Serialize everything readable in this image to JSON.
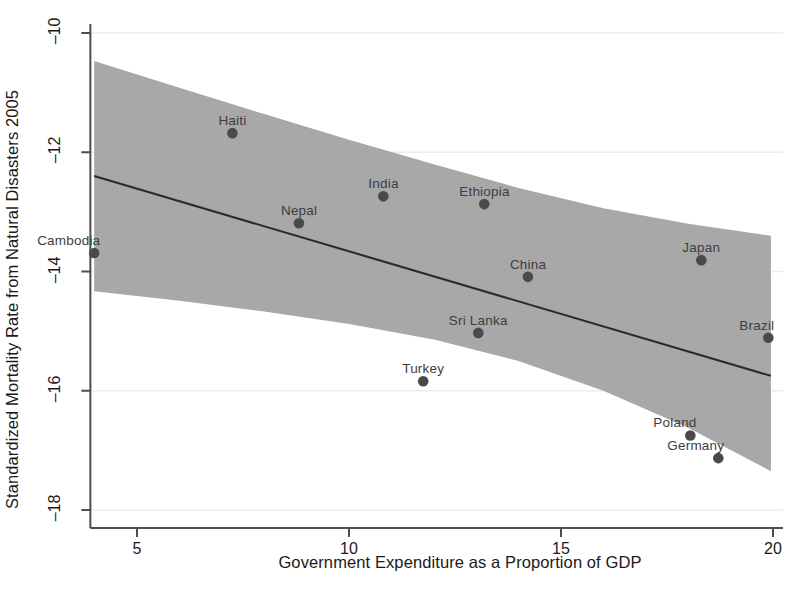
{
  "chart_data": {
    "type": "scatter",
    "title": "",
    "xlabel": "Government Expenditure as a Proportion of GDP",
    "ylabel": "Standardized Mortality Rate from Natural Disasters 2005",
    "xlim": [
      3.9,
      20.1
    ],
    "ylim": [
      -18.3,
      -9.85
    ],
    "xticks": [
      5,
      10,
      15,
      20
    ],
    "xtick_labels": [
      "5",
      "10",
      "15",
      "20"
    ],
    "yticks": [
      -10,
      -12,
      -14,
      -16,
      -18
    ],
    "ytick_labels": [
      "–10",
      "–12",
      "–14",
      "–16",
      "–18"
    ],
    "grid": "horizontal-faint",
    "legend": "none",
    "points": [
      {
        "label": "Cambodia",
        "x": 3.99,
        "y": -13.69,
        "label_pos": "above-left"
      },
      {
        "label": "Haiti",
        "x": 7.25,
        "y": -11.68,
        "label_pos": "above"
      },
      {
        "label": "Nepal",
        "x": 8.82,
        "y": -13.19,
        "label_pos": "above"
      },
      {
        "label": "India",
        "x": 10.81,
        "y": -12.74,
        "label_pos": "above"
      },
      {
        "label": "Turkey",
        "x": 11.75,
        "y": -15.84,
        "label_pos": "above"
      },
      {
        "label": "Sri Lanka",
        "x": 13.05,
        "y": -15.03,
        "label_pos": "above"
      },
      {
        "label": "Ethiopia",
        "x": 13.19,
        "y": -12.87,
        "label_pos": "above"
      },
      {
        "label": "China",
        "x": 14.22,
        "y": -14.09,
        "label_pos": "above"
      },
      {
        "label": "Poland",
        "x": 18.05,
        "y": -16.75,
        "label_pos": "above-left"
      },
      {
        "label": "Japan",
        "x": 18.31,
        "y": -13.81,
        "label_pos": "above"
      },
      {
        "label": "Germany",
        "x": 18.71,
        "y": -17.13,
        "label_pos": "above-left"
      },
      {
        "label": "Brazil",
        "x": 19.89,
        "y": -15.11,
        "label_pos": "above-left"
      }
    ],
    "fit_line": {
      "description": "linear fit",
      "x_start": 3.99,
      "y_start": -12.4,
      "x_end": 19.95,
      "y_end": -15.75
    },
    "confidence_band": {
      "description": "95% confidence interval shading",
      "color": "#a8a8a8",
      "upper": [
        {
          "x": 3.99,
          "y": -10.47
        },
        {
          "x": 6.0,
          "y": -10.92
        },
        {
          "x": 8.0,
          "y": -11.36
        },
        {
          "x": 10.0,
          "y": -11.79
        },
        {
          "x": 12.0,
          "y": -12.2
        },
        {
          "x": 14.0,
          "y": -12.6
        },
        {
          "x": 16.0,
          "y": -12.94
        },
        {
          "x": 18.0,
          "y": -13.2
        },
        {
          "x": 19.95,
          "y": -13.4
        }
      ],
      "lower": [
        {
          "x": 3.99,
          "y": -14.33
        },
        {
          "x": 6.0,
          "y": -14.49
        },
        {
          "x": 8.0,
          "y": -14.67
        },
        {
          "x": 10.0,
          "y": -14.88
        },
        {
          "x": 12.0,
          "y": -15.14
        },
        {
          "x": 14.0,
          "y": -15.5
        },
        {
          "x": 16.0,
          "y": -16.0
        },
        {
          "x": 18.0,
          "y": -16.62
        },
        {
          "x": 19.95,
          "y": -17.35
        }
      ]
    },
    "style": {
      "marker_color": "#4a4a4a",
      "marker_size": 8,
      "line_color": "#2b2b2b",
      "axis_color": "#4d4d4d",
      "band_color": "#a8a8a8",
      "text_color": "#1a1a1a",
      "point_label_color": "#3d3d3d"
    }
  }
}
